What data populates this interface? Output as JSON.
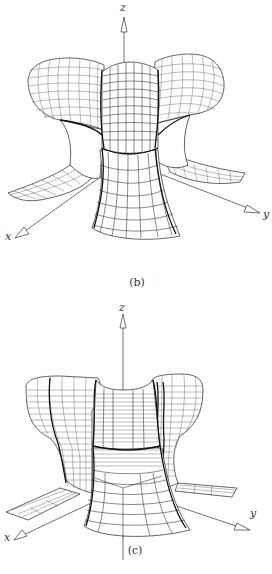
{
  "figures": [
    {
      "id": "b",
      "caption": "(b)",
      "axes": {
        "x_label": "x",
        "y_label": "y",
        "z_label": "z"
      },
      "description": "Wireframe 3D surface with four rounded bulbous lobes on top and flared legs"
    },
    {
      "id": "c",
      "caption": "(c)",
      "axes": {
        "x_label": "x",
        "y_label": "y",
        "z_label": "z"
      },
      "description": "Wireframe 3D surface with four flat-topped lobes, dense horizontal contour lines and flat flanges"
    }
  ]
}
